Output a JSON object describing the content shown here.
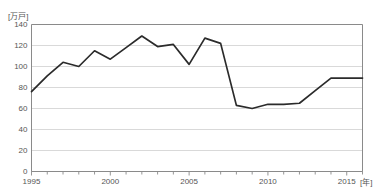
{
  "chart_data": {
    "type": "line",
    "title": "",
    "subtitle": "",
    "xlabel": "[年]",
    "ylabel": "[万戸]",
    "xlim": [
      1995,
      2016
    ],
    "ylim": [
      0,
      140
    ],
    "grid": true,
    "legend": "none",
    "y_ticks": [
      0,
      20,
      40,
      60,
      80,
      100,
      120,
      140
    ],
    "y_tick_labels": [
      "0",
      "20",
      "40",
      "60",
      "80",
      "100",
      "120",
      "140"
    ],
    "x_ticks": [
      1995,
      2000,
      2005,
      2010,
      2015
    ],
    "x_tick_labels": [
      "1995",
      "2000",
      "2005",
      "2010",
      "2015"
    ],
    "x_minor_ticks": [
      1996,
      1997,
      1998,
      1999,
      2001,
      2002,
      2003,
      2004,
      2006,
      2007,
      2008,
      2009,
      2011,
      2012,
      2013,
      2014,
      2016
    ],
    "series": [
      {
        "name": "新設住宅着工戸数",
        "color": "#2b2b2b",
        "x": [
          1995,
          1996,
          1997,
          1998,
          1999,
          2000,
          2001,
          2002,
          2003,
          2004,
          2005,
          2006,
          2007,
          2008,
          2009,
          2010,
          2011,
          2012,
          2013,
          2014,
          2015,
          2016
        ],
        "values": [
          76,
          91,
          104,
          100,
          115,
          107,
          118,
          129,
          119,
          121,
          102,
          127,
          122,
          63,
          60,
          64,
          64,
          65,
          77,
          89,
          89,
          89
        ]
      }
    ]
  },
  "axes": {
    "y_unit_label": "[万戸]",
    "x_unit_label": "[年]"
  },
  "colors": {
    "line": "#2b2b2b",
    "grid": "#cfcfcf",
    "axis": "#8a8a8a",
    "text": "#555555",
    "background": "#ffffff"
  }
}
